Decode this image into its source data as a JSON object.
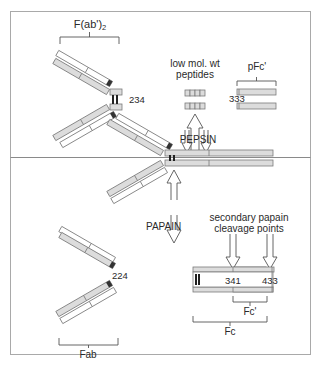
{
  "diagram": {
    "colors": {
      "frame": "#a9a9a9",
      "heavy_chain_fill": "#dcdcdc",
      "light_chain_fill": "#ffffff",
      "chain_stroke": "#7a7a7a",
      "disulfide": "#222222",
      "text": "#2a2a2a"
    },
    "labels": {
      "fab2": "F(ab')",
      "fab2_subscript": "2",
      "hinge_residue_top": "234",
      "low_mol_wt_line1": "low mol. wt",
      "low_mol_wt_line2": "peptides",
      "pfc": "pFc'",
      "pfc_residue": "333",
      "pepsin": "PEPSIN",
      "papain": "PAPAIN",
      "fab_residue": "224",
      "fab": "Fab",
      "secondary_line1": "secondary papain",
      "secondary_line2": "cleavage points",
      "residue_341": "341",
      "residue_433": "433",
      "fc_prime": "Fc'",
      "fc": "Fc"
    },
    "regions": [
      {
        "name": "pepsin-digestion",
        "position": "top half"
      },
      {
        "name": "papain-digestion",
        "position": "bottom half"
      }
    ]
  }
}
